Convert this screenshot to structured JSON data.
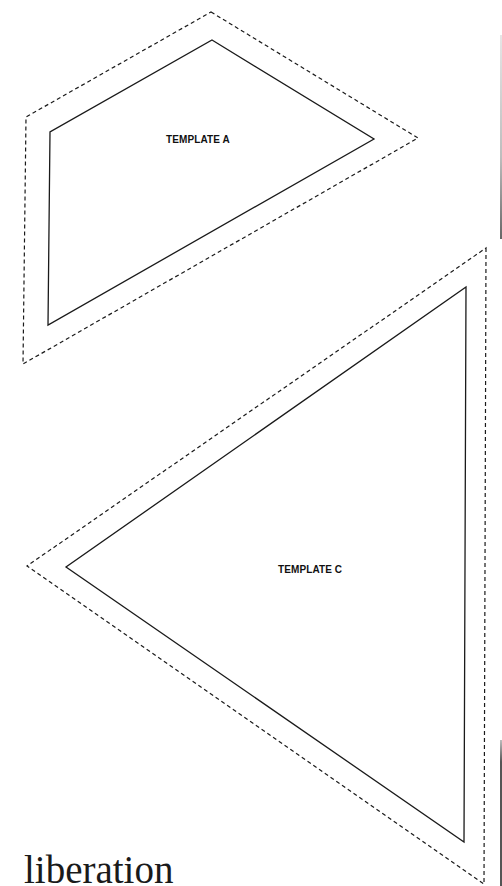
{
  "templates": [
    {
      "id": "A",
      "label": "TEMPLATE A",
      "shape": "quadrilateral",
      "cut_line_points": "211,12 418,138 23,364 26,117",
      "sew_line_points": "212,40 374,139 48,325 50,132"
    },
    {
      "id": "C",
      "label": "TEMPLATE C",
      "shape": "triangle",
      "cut_line_points": "486,248 484,884 27,566",
      "sew_line_points": "466,287 464,842 66,567"
    }
  ],
  "legend": {
    "cut_line_style": "dashed",
    "sew_line_style": "solid"
  },
  "brand": {
    "text": "liberation"
  },
  "colors": {
    "background": "#ffffff",
    "line": "#1a1a1a",
    "edge_line_light": "#cfcfcf",
    "edge_line_dark": "#555555"
  }
}
